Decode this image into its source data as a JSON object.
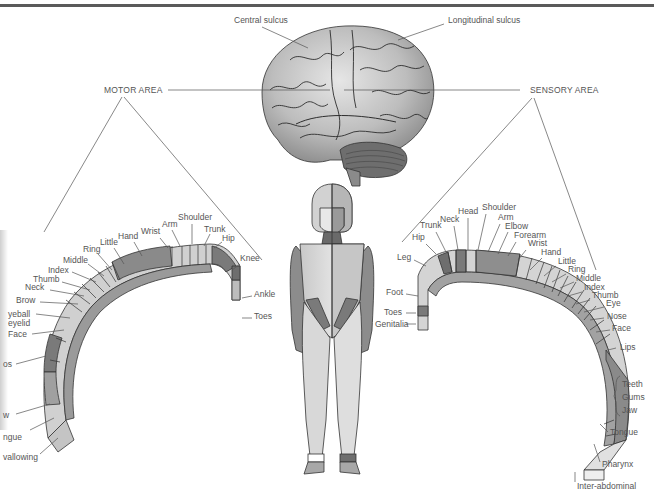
{
  "brain": {
    "labels": {
      "central_sulcus": "Central sulcus",
      "longitudinal_sulcus": "Longitudinal sulcus",
      "motor_area": "MOTOR AREA",
      "sensory_area": "SENSORY AREA"
    }
  },
  "motor_strip": {
    "labels": [
      "Toes",
      "Ankle",
      "Knee",
      "Hip",
      "Trunk",
      "Shoulder",
      "Arm",
      "Wrist",
      "Hand",
      "Little",
      "Ring",
      "Middle",
      "Index",
      "Thumb",
      "Neck",
      "Brow",
      "yeball",
      "eyelid",
      "Face",
      "os",
      "w",
      "ngue",
      "vallowing"
    ]
  },
  "sensory_strip": {
    "labels": [
      "Genitalia",
      "Toes",
      "Foot",
      "Leg",
      "Hip",
      "Trunk",
      "Neck",
      "Head",
      "Shoulder",
      "Arm",
      "Elbow",
      "Forearm",
      "Wrist",
      "Hand",
      "Little",
      "Ring",
      "Middle",
      "Index",
      "Thumb",
      "Eye",
      "Nose",
      "Face",
      "Lips",
      "Teeth",
      "Gums",
      "Jaw",
      "Tongue",
      "Pharynx",
      "Inter-abdominal"
    ]
  },
  "colors": {
    "dark": "#7a7a7a",
    "mid": "#a6a6a6",
    "light": "#d4d4d4",
    "pale": "#ececec",
    "line": "#555555"
  }
}
